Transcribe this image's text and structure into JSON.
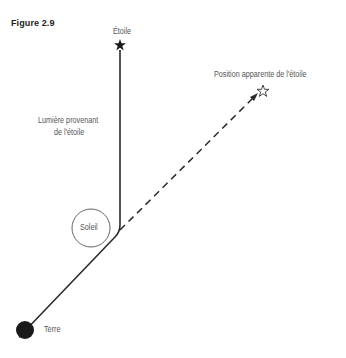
{
  "figure": {
    "title": "Figure 2.9",
    "labels": {
      "star": "Étoile",
      "apparent_position": "Position apparente de l'étoile",
      "light_line1": "Lumière provenant",
      "light_line2": "de l'étoile",
      "sun": "Soleil",
      "earth": "Terre"
    },
    "colors": {
      "line": "#2a2a2a",
      "earth": "#1a1a1a",
      "text": "#555555"
    }
  }
}
